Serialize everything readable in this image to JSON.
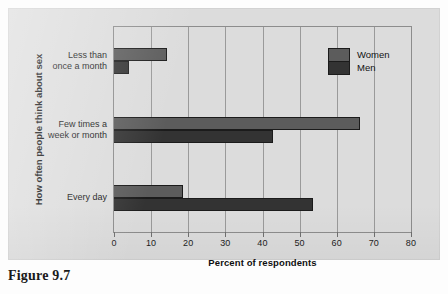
{
  "caption": "Figure 9.7",
  "legend": {
    "position": "top-right",
    "entries": [
      {
        "label": "Women",
        "color": "#5c5c5c"
      },
      {
        "label": "Men",
        "color": "#333333"
      }
    ]
  },
  "chart_data": {
    "type": "bar",
    "orientation": "horizontal",
    "title": "",
    "xlabel": "Percent of respondents",
    "ylabel": "How often people think about sex",
    "categories": [
      "Less than\nonce a month",
      "Few times a\nweek or month",
      "Every day"
    ],
    "series": [
      {
        "name": "Women",
        "color": "#5c5c5c",
        "values": [
          14.4,
          66.3,
          18.5
        ]
      },
      {
        "name": "Men",
        "color": "#333333",
        "values": [
          4.0,
          42.7,
          53.5
        ]
      }
    ],
    "xlim": [
      0,
      80
    ],
    "xticks": [
      0,
      10,
      20,
      30,
      40,
      50,
      60,
      70,
      80
    ],
    "xtick_labels": [
      "0",
      "10",
      "20",
      "30",
      "40",
      "50",
      "60",
      "70",
      "80"
    ],
    "grid": "vertical",
    "legend_position": "top right"
  }
}
